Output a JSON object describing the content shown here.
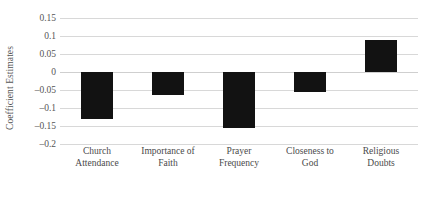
{
  "chart_data": {
    "type": "bar",
    "title": "",
    "xlabel": "",
    "ylabel": "Coefficient Estimates",
    "categories": [
      "Church Attendance",
      "Importance of Faith",
      "Prayer Frequency",
      "Closeness to God",
      "Religious Doubts"
    ],
    "category_lines": [
      [
        "Church",
        "Attendance"
      ],
      [
        "Importance of",
        "Faith"
      ],
      [
        "Prayer",
        "Frequency"
      ],
      [
        "Closeness to",
        "God"
      ],
      [
        "Religious",
        "Doubts"
      ]
    ],
    "values": [
      -0.13,
      -0.065,
      -0.155,
      -0.055,
      0.088
    ],
    "ylim": [
      -0.2,
      0.15
    ],
    "ytick_values": [
      0.15,
      0.1,
      0.05,
      0,
      -0.05,
      -0.1,
      -0.15,
      -0.2
    ],
    "ytick_labels": [
      "0.15",
      "0.1",
      "0.05",
      "0",
      "–0.05",
      "–0.1",
      "–0.15",
      "–0.2"
    ],
    "grid": true,
    "legend": false,
    "bar_color": "#121212",
    "gridline_color": "#d8d8d8",
    "background_color": "#ffffff"
  }
}
